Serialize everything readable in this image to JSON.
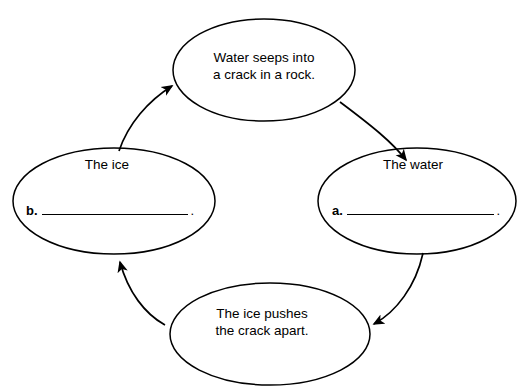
{
  "diagram": {
    "type": "cycle",
    "direction": "clockwise",
    "shape": "ellipse",
    "stroke_color": "#000000",
    "background_color": "#ffffff",
    "nodes": [
      {
        "id": "top",
        "position": "top",
        "text": "Water seeps into\na crack in a rock."
      },
      {
        "id": "right",
        "position": "right",
        "heading": "The water",
        "blank_marker": "a.",
        "blank_value": "",
        "blank_period": "."
      },
      {
        "id": "bottom",
        "position": "bottom",
        "text": "The ice pushes\nthe crack apart."
      },
      {
        "id": "left",
        "position": "left",
        "heading": "The ice",
        "blank_marker": "b.",
        "blank_value": "",
        "blank_period": "."
      }
    ],
    "arrows": [
      {
        "id": "top-to-right",
        "from": "top",
        "to": "right"
      },
      {
        "id": "right-to-bottom",
        "from": "right",
        "to": "bottom"
      },
      {
        "id": "bottom-to-left",
        "from": "bottom",
        "to": "left"
      },
      {
        "id": "left-to-top",
        "from": "left",
        "to": "top"
      }
    ]
  }
}
